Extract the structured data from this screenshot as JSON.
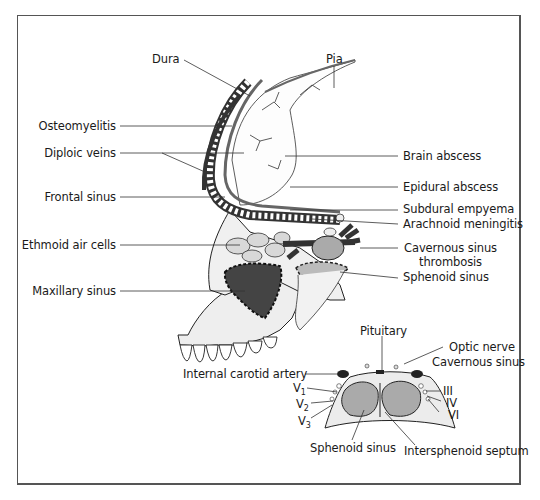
{
  "figure": {
    "labels_left": [
      {
        "id": "dura",
        "text": "Dura"
      },
      {
        "id": "osteomyelitis",
        "text": "Osteomyelitis"
      },
      {
        "id": "diploic-veins",
        "text": "Diploic veins"
      },
      {
        "id": "frontal-sinus",
        "text": "Frontal sinus"
      },
      {
        "id": "ethmoid-air-cells",
        "text": "Ethmoid air cells"
      },
      {
        "id": "maxillary-sinus",
        "text": "Maxillary sinus"
      }
    ],
    "labels_right": [
      {
        "id": "pia",
        "text": "Pia"
      },
      {
        "id": "brain-abscess",
        "text": "Brain abscess"
      },
      {
        "id": "epidural-abscess",
        "text": "Epidural abscess"
      },
      {
        "id": "subdural-empyema",
        "text": "Subdural empyema"
      },
      {
        "id": "arachnoid-meningitis",
        "text": "Arachnoid meningitis"
      },
      {
        "id": "cavernous-sinus-thrombosis-1",
        "text": "Cavernous sinus"
      },
      {
        "id": "cavernous-sinus-thrombosis-2",
        "text": "thrombosis"
      },
      {
        "id": "sphenoid-sinus-upper",
        "text": "Sphenoid sinus"
      }
    ],
    "inset": {
      "pituitary": "Pituitary",
      "optic_nerve": "Optic nerve",
      "cavernous_sinus": "Cavernous sinus",
      "internal_carotid_artery": "Internal carotid artery",
      "v1": "V",
      "v1_sub": "1",
      "v2": "V",
      "v2_sub": "2",
      "v3": "V",
      "v3_sub": "3",
      "cn3": "III",
      "cn4": "IV",
      "cn6": "VI",
      "sphenoid_sinus": "Sphenoid sinus",
      "intersphenoid_septum": "Intersphenoid septum"
    },
    "colors": {
      "frame": "#555555",
      "ink": "#1a1a1a",
      "bone_fill": "#ededed",
      "dark_fill": "#3a3a3a"
    }
  }
}
